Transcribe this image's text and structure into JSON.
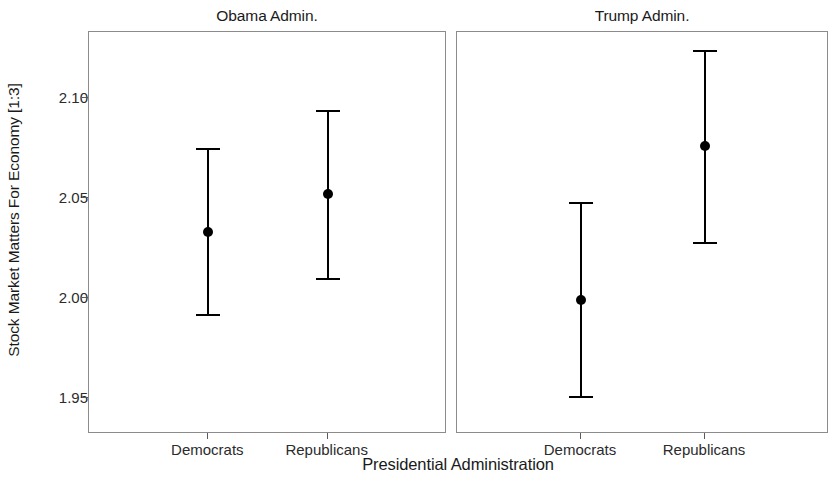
{
  "chart_data": {
    "type": "scatter",
    "title": "",
    "xlabel": "Presidential Administration",
    "ylabel": "Stock Market Matters For Economy [1:3]",
    "ylim": [
      1.932,
      2.133
    ],
    "yticks": [
      "1.95",
      "2.00",
      "2.05",
      "2.10"
    ],
    "ytick_values": [
      1.95,
      2.0,
      2.05,
      2.1
    ],
    "grid": false,
    "legend": null,
    "categories": [
      "Democrats",
      "Republicans"
    ],
    "panels": [
      {
        "label": "Obama Admin.",
        "points": [
          {
            "category": "Democrats",
            "value": 2.033,
            "ci_low": 1.991,
            "ci_high": 2.075
          },
          {
            "category": "Republicans",
            "value": 2.052,
            "ci_low": 2.009,
            "ci_high": 2.094
          }
        ]
      },
      {
        "label": "Trump Admin.",
        "points": [
          {
            "category": "Democrats",
            "value": 1.999,
            "ci_low": 1.95,
            "ci_high": 2.048
          },
          {
            "category": "Republicans",
            "value": 2.076,
            "ci_low": 2.027,
            "ci_high": 2.124
          }
        ]
      }
    ],
    "marker_color": "#000000",
    "errorbar_color": "#000000",
    "panel_border_color": "#8c8c8c"
  }
}
